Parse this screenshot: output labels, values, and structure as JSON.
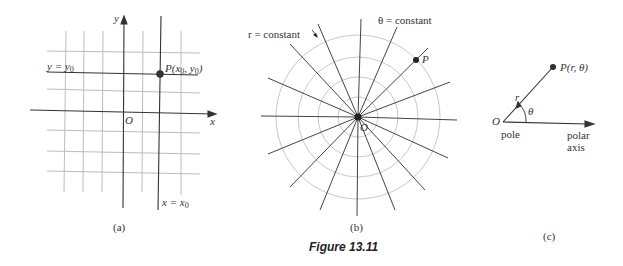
{
  "figure": {
    "caption": "Figure 13.11",
    "panels": [
      {
        "id": "a",
        "label": "(a)",
        "title": "Rectangular coordinate grid",
        "axis_x": "x",
        "axis_y": "y",
        "origin": "O",
        "horizontal_line_label": "y = y",
        "horizontal_line_sub": "0",
        "vertical_line_label": "x = x",
        "vertical_line_sub": "0",
        "point_label_prefix": "P(x",
        "point_label_mid": ", y",
        "point_label_suffix": ")",
        "point_sub": "0"
      },
      {
        "id": "b",
        "label": "(b)",
        "title": "Polar coordinate grid",
        "r_label": "r = constant",
        "theta_label": "θ = constant",
        "point_label": "P",
        "origin": "O",
        "circle_count": 4,
        "ray_count": 16
      },
      {
        "id": "c",
        "label": "(c)",
        "title": "Polar coordinates of a point",
        "origin": "O",
        "point_label": "P(r, θ)",
        "r_label": "r",
        "theta_label": "θ",
        "pole_label": "pole",
        "polar_axis_line1": "polar",
        "polar_axis_line2": "axis"
      }
    ]
  },
  "colors": {
    "axis": "#333333",
    "grid": "#bdbdbd",
    "circle": "#c8c8c8",
    "ray": "#444444",
    "text": "#333333"
  }
}
